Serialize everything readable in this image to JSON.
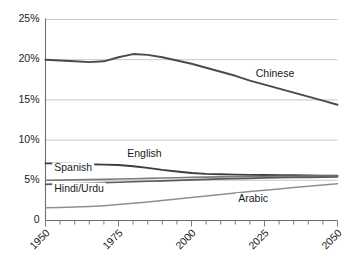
{
  "chart_data": {
    "type": "line",
    "title": "",
    "subtitle": "",
    "xlabel": "",
    "ylabel": "",
    "xlim": [
      1950,
      2050
    ],
    "ylim": [
      0,
      25
    ],
    "grid": true,
    "legend_position": "inline-annotations",
    "y_ticks": [
      0,
      5,
      10,
      15,
      20,
      25
    ],
    "y_tick_labels": [
      "0",
      "5%",
      "10%",
      "15%",
      "20%",
      "25%"
    ],
    "x_ticks": [
      1950,
      1975,
      2000,
      2025,
      2050
    ],
    "x_tick_labels": [
      "1950",
      "1975",
      "2000",
      "2025",
      "2050"
    ],
    "x_minor_tick_step": 5,
    "x": [
      1950,
      1955,
      1960,
      1965,
      1970,
      1975,
      1980,
      1985,
      1990,
      1995,
      2000,
      2005,
      2010,
      2015,
      2020,
      2025,
      2030,
      2035,
      2040,
      2045,
      2050
    ],
    "series": [
      {
        "name": "Chinese",
        "color": "#4a4a4a",
        "width": 1.9,
        "values": [
          20.0,
          19.9,
          19.8,
          19.7,
          19.8,
          20.3,
          20.7,
          20.6,
          20.3,
          19.9,
          19.5,
          19.0,
          18.5,
          18.0,
          17.4,
          16.9,
          16.4,
          15.9,
          15.4,
          14.9,
          14.4
        ],
        "label": "Chinese",
        "label_x": 2022,
        "label_y": 17.9
      },
      {
        "name": "English",
        "color": "#3d3d3d",
        "width": 1.9,
        "values": [
          7.1,
          7.1,
          7.05,
          7.0,
          6.95,
          6.9,
          6.75,
          6.55,
          6.3,
          6.1,
          5.9,
          5.8,
          5.75,
          5.7,
          5.68,
          5.66,
          5.64,
          5.62,
          5.6,
          5.58,
          5.56
        ],
        "label": "English",
        "label_x": 1978,
        "label_y": 7.9
      },
      {
        "name": "Spanish",
        "color": "#7d7d7d",
        "width": 1.6,
        "values": [
          5.0,
          5.02,
          5.05,
          5.08,
          5.12,
          5.16,
          5.2,
          5.24,
          5.28,
          5.32,
          5.36,
          5.39,
          5.42,
          5.44,
          5.46,
          5.48,
          5.5,
          5.51,
          5.52,
          5.53,
          5.54
        ],
        "label": "Spanish",
        "label_x": 1953,
        "label_y": 6.1
      },
      {
        "name": "Hindi/Urdu",
        "color": "#5a5a5a",
        "width": 1.7,
        "values": [
          4.5,
          4.55,
          4.6,
          4.65,
          4.7,
          4.76,
          4.82,
          4.88,
          4.94,
          5.0,
          5.06,
          5.12,
          5.17,
          5.21,
          5.25,
          5.29,
          5.32,
          5.35,
          5.37,
          5.39,
          5.41
        ],
        "label": "Hindi/Urdu",
        "label_x": 1953,
        "label_y": 3.6
      },
      {
        "name": "Arabic",
        "color": "#8f8f8f",
        "width": 1.5,
        "values": [
          1.6,
          1.63,
          1.68,
          1.75,
          1.85,
          1.98,
          2.13,
          2.3,
          2.48,
          2.67,
          2.87,
          3.06,
          3.24,
          3.42,
          3.6,
          3.77,
          3.93,
          4.1,
          4.26,
          4.42,
          4.58
        ],
        "label": "Arabic",
        "label_x": 2016,
        "label_y": 2.3
      }
    ]
  },
  "colors": {
    "gridline": "#b9b9b9",
    "axis": "#6e6e6e",
    "text": "#1a1a1a",
    "background": "#ffffff"
  }
}
